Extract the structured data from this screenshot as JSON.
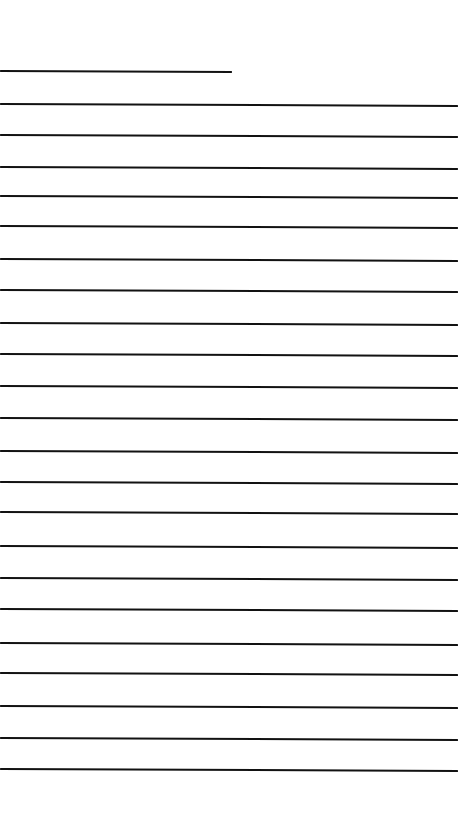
{
  "page": {
    "width": 460,
    "height": 825,
    "background_color": "#ffffff",
    "line_color": "#121212",
    "line_thickness_px": 2,
    "line_count": 23
  },
  "rules": [
    {
      "index": 1,
      "role": "title-rule",
      "y": 70,
      "x_start": 0,
      "x_end": 232,
      "length": 232,
      "slant_px": 1
    },
    {
      "index": 2,
      "role": "body-rule",
      "y": 103,
      "x_start": 0,
      "x_end": 458,
      "length": 458,
      "slant_px": 2
    },
    {
      "index": 3,
      "role": "body-rule",
      "y": 134,
      "x_start": 0,
      "x_end": 458,
      "length": 458,
      "slant_px": 2
    },
    {
      "index": 4,
      "role": "body-rule",
      "y": 166,
      "x_start": 0,
      "x_end": 458,
      "length": 458,
      "slant_px": 2
    },
    {
      "index": 5,
      "role": "body-rule",
      "y": 195,
      "x_start": 0,
      "x_end": 458,
      "length": 458,
      "slant_px": 2
    },
    {
      "index": 6,
      "role": "body-rule",
      "y": 225,
      "x_start": 0,
      "x_end": 458,
      "length": 458,
      "slant_px": 2
    },
    {
      "index": 7,
      "role": "body-rule",
      "y": 258,
      "x_start": 0,
      "x_end": 458,
      "length": 458,
      "slant_px": 2
    },
    {
      "index": 8,
      "role": "body-rule",
      "y": 289,
      "x_start": 0,
      "x_end": 458,
      "length": 458,
      "slant_px": 2
    },
    {
      "index": 9,
      "role": "body-rule",
      "y": 322,
      "x_start": 0,
      "x_end": 458,
      "length": 458,
      "slant_px": 2
    },
    {
      "index": 10,
      "role": "body-rule",
      "y": 353,
      "x_start": 0,
      "x_end": 458,
      "length": 458,
      "slant_px": 2
    },
    {
      "index": 11,
      "role": "body-rule",
      "y": 385,
      "x_start": 0,
      "x_end": 458,
      "length": 458,
      "slant_px": 2
    },
    {
      "index": 12,
      "role": "body-rule",
      "y": 417,
      "x_start": 0,
      "x_end": 458,
      "length": 458,
      "slant_px": 2
    },
    {
      "index": 13,
      "role": "body-rule",
      "y": 450,
      "x_start": 0,
      "x_end": 458,
      "length": 458,
      "slant_px": 2
    },
    {
      "index": 14,
      "role": "body-rule",
      "y": 481,
      "x_start": 0,
      "x_end": 458,
      "length": 458,
      "slant_px": 2
    },
    {
      "index": 15,
      "role": "body-rule",
      "y": 511,
      "x_start": 0,
      "x_end": 458,
      "length": 458,
      "slant_px": 2
    },
    {
      "index": 16,
      "role": "body-rule",
      "y": 545,
      "x_start": 0,
      "x_end": 458,
      "length": 458,
      "slant_px": 2
    },
    {
      "index": 17,
      "role": "body-rule",
      "y": 577,
      "x_start": 0,
      "x_end": 458,
      "length": 458,
      "slant_px": 2
    },
    {
      "index": 18,
      "role": "body-rule",
      "y": 608,
      "x_start": 0,
      "x_end": 458,
      "length": 458,
      "slant_px": 2
    },
    {
      "index": 19,
      "role": "body-rule",
      "y": 642,
      "x_start": 0,
      "x_end": 458,
      "length": 458,
      "slant_px": 2
    },
    {
      "index": 20,
      "role": "body-rule",
      "y": 672,
      "x_start": 0,
      "x_end": 458,
      "length": 458,
      "slant_px": 2
    },
    {
      "index": 21,
      "role": "body-rule",
      "y": 705,
      "x_start": 0,
      "x_end": 458,
      "length": 458,
      "slant_px": 2
    },
    {
      "index": 22,
      "role": "body-rule",
      "y": 737,
      "x_start": 0,
      "x_end": 458,
      "length": 458,
      "slant_px": 2
    },
    {
      "index": 23,
      "role": "body-rule",
      "y": 768,
      "x_start": 0,
      "x_end": 458,
      "length": 458,
      "slant_px": 2
    }
  ]
}
